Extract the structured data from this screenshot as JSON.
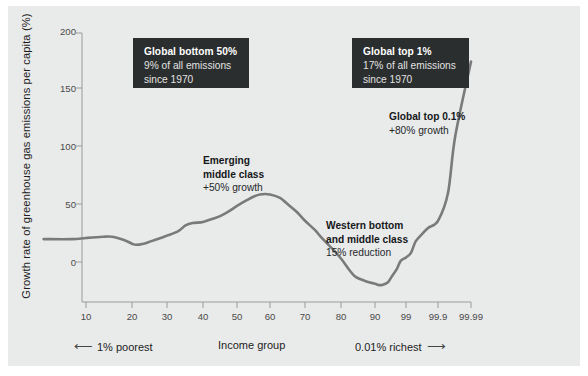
{
  "figure": {
    "panel_background": "#e9eaea",
    "page_background": "#ffffff",
    "line_color": "#7a7a7a",
    "callout_background": "#2b2e2e"
  },
  "axes": {
    "ylabel": "Growth rate of greenhouse gas emissions per capita (%)",
    "xlabel": "Income group",
    "y_ticks": [
      "0",
      "50",
      "100",
      "150",
      "200"
    ],
    "x_ticks": [
      "10",
      "20",
      "30",
      "40",
      "50",
      "60",
      "70",
      "80",
      "90",
      "99",
      "99.9",
      "99.99"
    ]
  },
  "footer": {
    "left_arrow": "⟵",
    "left_text": "1% poorest",
    "center_text": "Income group",
    "right_text": "0.01% richest",
    "right_arrow": "⟶"
  },
  "callouts": [
    {
      "id": "global-bottom-50",
      "title": "Global bottom 50%",
      "line1": "9% of all emissions",
      "line2": "since 1970"
    },
    {
      "id": "global-top-1",
      "title": "Global top 1%",
      "line1": "17% of all emissions",
      "line2": "since 1970"
    }
  ],
  "annotations": [
    {
      "id": "emerging-middle-class",
      "title_line1": "Emerging",
      "title_line2": "middle class",
      "value": "+50% growth"
    },
    {
      "id": "global-top-01",
      "title_line1": "Global top 0.1%",
      "title_line2": "",
      "value": "+80% growth"
    },
    {
      "id": "western-bottom-middle",
      "title_line1": "Western bottom",
      "title_line2": "and middle class",
      "value": "15% reduction"
    }
  ],
  "chart_data": {
    "type": "line",
    "title": "",
    "subtitle": "",
    "xlabel": "Income group",
    "ylabel": "Growth rate of greenhouse gas emissions per capita (%)",
    "xscale": "income-percentile (log-odds spacing)",
    "x_tick_labels": [
      "10",
      "20",
      "30",
      "40",
      "50",
      "60",
      "70",
      "80",
      "90",
      "99",
      "99.9",
      "99.99"
    ],
    "x_tick_pixels": [
      86,
      132,
      167,
      203,
      237,
      270,
      305,
      341,
      375,
      406,
      438,
      471
    ],
    "y_tick_labels": [
      "0",
      "50",
      "100",
      "150",
      "200"
    ],
    "ylim": [
      -40,
      215
    ],
    "grid": false,
    "legend": null,
    "series": [
      {
        "name": "Growth rate of greenhouse gas emissions per capita",
        "color": "#7a7a7a",
        "x": [
          5,
          8,
          10,
          13,
          15,
          18,
          20,
          21,
          23,
          25,
          28,
          30,
          33,
          35,
          37,
          40,
          43,
          45,
          48,
          50,
          53,
          55,
          57,
          60,
          63,
          65,
          68,
          70,
          73,
          75,
          78,
          80,
          83,
          85,
          88,
          90,
          92,
          94,
          96,
          97,
          98,
          98.5,
          99,
          99.3,
          99.5,
          99.7,
          99.8,
          99.9,
          99.95,
          99.97,
          99.99
        ],
        "y": [
          20,
          20,
          21,
          22,
          22,
          19,
          16,
          15,
          16,
          18,
          21,
          23,
          27,
          32,
          34,
          35,
          38,
          40,
          45,
          49,
          54,
          57,
          59,
          59,
          56,
          51,
          43,
          36,
          28,
          21,
          11,
          3,
          -7,
          -13,
          -17,
          -19,
          -20,
          -20,
          -18,
          -13,
          -6,
          1,
          4,
          8,
          18,
          25,
          30,
          36,
          60,
          110,
          175
        ]
      }
    ],
    "annotated_values": {
      "global_bottom_50_share": "9% of all emissions since 1970",
      "global_top_1_share": "17% of all emissions since 1970",
      "emerging_middle_class_growth": "+50% growth",
      "global_top_01_growth": "+80% growth",
      "western_bottom_and_middle_class": "15% reduction"
    }
  }
}
